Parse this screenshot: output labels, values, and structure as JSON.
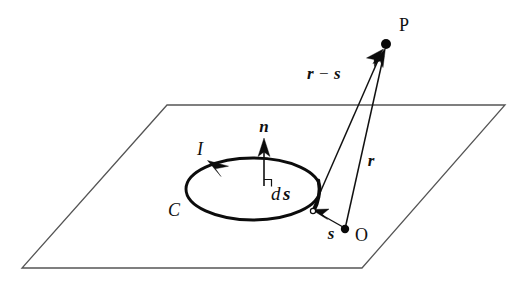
{
  "figure": {
    "background_color": "#ffffff",
    "ink_color": "#101010",
    "plane_edge_color": "#555555"
  },
  "labels": {
    "point_p": "P",
    "point_o": "O",
    "current": "I",
    "contour": "C",
    "normal": "n",
    "line_element": "ds",
    "line_element_d": "d",
    "line_element_s": "s",
    "vector_r": "r",
    "vector_s": "s",
    "vector_r_minus_s_first": "r",
    "vector_r_minus_s_op": "−",
    "vector_r_minus_s_second": "s"
  },
  "geometry": {
    "plane": {
      "name": "surface-plane",
      "corners": "167,105 505,105 362,268 22,268"
    },
    "loop": {
      "name": "current-loop-C",
      "center_x": 253,
      "center_y": 189,
      "radius_x": 67,
      "radius_y": 31
    },
    "points": {
      "P": {
        "x": 386,
        "y": 44
      },
      "O": {
        "x": 345,
        "y": 229
      },
      "ds": {
        "x": 313,
        "y": 212
      }
    },
    "vectors": [
      {
        "name": "r",
        "from": "O",
        "to": "P"
      },
      {
        "name": "r-minus-s",
        "from": "ds",
        "to": "P"
      },
      {
        "name": "s",
        "from": "O",
        "to": "ds"
      },
      {
        "name": "n",
        "from": "loop-center",
        "to": "above-loop"
      }
    ]
  }
}
